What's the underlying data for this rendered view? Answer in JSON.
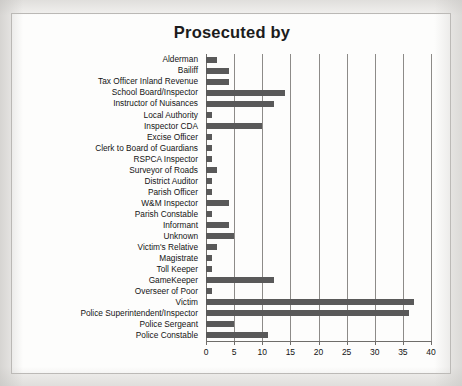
{
  "chart_data": {
    "type": "bar",
    "orientation": "horizontal",
    "title": "Prosecuted by",
    "xlabel": "",
    "ylabel": "",
    "xlim": [
      0,
      40
    ],
    "xticks": [
      0,
      5,
      10,
      15,
      20,
      25,
      30,
      35,
      40
    ],
    "grid": "vertical",
    "legend": "none",
    "bar_color": "#595959",
    "categories": [
      "Alderman",
      "Bailiff",
      "Tax Officer Inland Revenue",
      "School Board/Inspector",
      "Instructor of Nuisances",
      "Local Authority",
      "Inspector CDA",
      "Excise Officer",
      "Clerk to Board of Guardians",
      "RSPCA Inspector",
      "Surveyor of Roads",
      "District Auditor",
      "Parish Officer",
      "W&M Inspector",
      "Parish Constable",
      "Informant",
      "Unknown",
      "Victim's Relative",
      "Magistrate",
      "Toll Keeper",
      "GameKeeper",
      "Overseer of Poor",
      "Victim",
      "Police Superintendent/Inspector",
      "Police Sergeant",
      "Police Constable"
    ],
    "values": [
      2,
      4,
      4,
      14,
      12,
      1,
      10,
      1,
      1,
      1,
      2,
      1,
      1,
      4,
      1,
      4,
      5,
      2,
      1,
      1,
      12,
      1,
      37,
      36,
      5,
      11
    ]
  }
}
